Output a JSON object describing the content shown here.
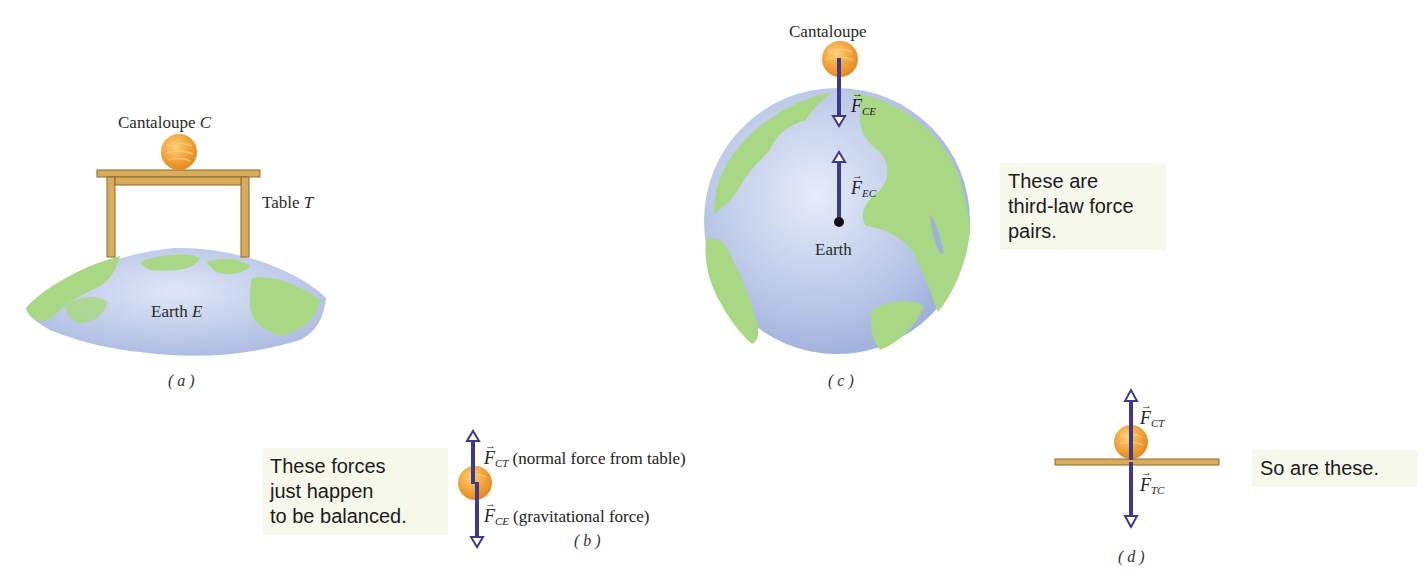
{
  "colors": {
    "arrow": "#3c3a8f",
    "cantaloupe": "#f0a03a",
    "table": "#d9ac5c",
    "earth_land": "#a9d884",
    "earth_water": "#b8c6e6",
    "note_bg": "#f7f8ec"
  },
  "panel_a": {
    "cantaloupe_label": "Cantaloupe",
    "cantaloupe_symbol": "C",
    "table_label": "Table",
    "table_symbol": "T",
    "earth_label": "Earth",
    "earth_symbol": "E",
    "caption": "( a )"
  },
  "panel_b": {
    "note": [
      "These forces",
      "just happen",
      "to be balanced."
    ],
    "force_up": {
      "symbol": "F",
      "subscript": "CT",
      "description": "(normal force from table)"
    },
    "force_down": {
      "symbol": "F",
      "subscript": "CE",
      "description": "(gravitational force)"
    },
    "caption": "( b )"
  },
  "panel_c": {
    "cantaloupe_label": "Cantaloupe",
    "earth_label": "Earth",
    "force_down": {
      "symbol": "F",
      "subscript": "CE"
    },
    "force_up": {
      "symbol": "F",
      "subscript": "EC"
    },
    "note": [
      "These are",
      "third-law force",
      "pairs."
    ],
    "caption": "( c )"
  },
  "panel_d": {
    "force_up": {
      "symbol": "F",
      "subscript": "CT"
    },
    "force_down": {
      "symbol": "F",
      "subscript": "TC"
    },
    "note": [
      "So are these."
    ],
    "caption": "( d )"
  }
}
